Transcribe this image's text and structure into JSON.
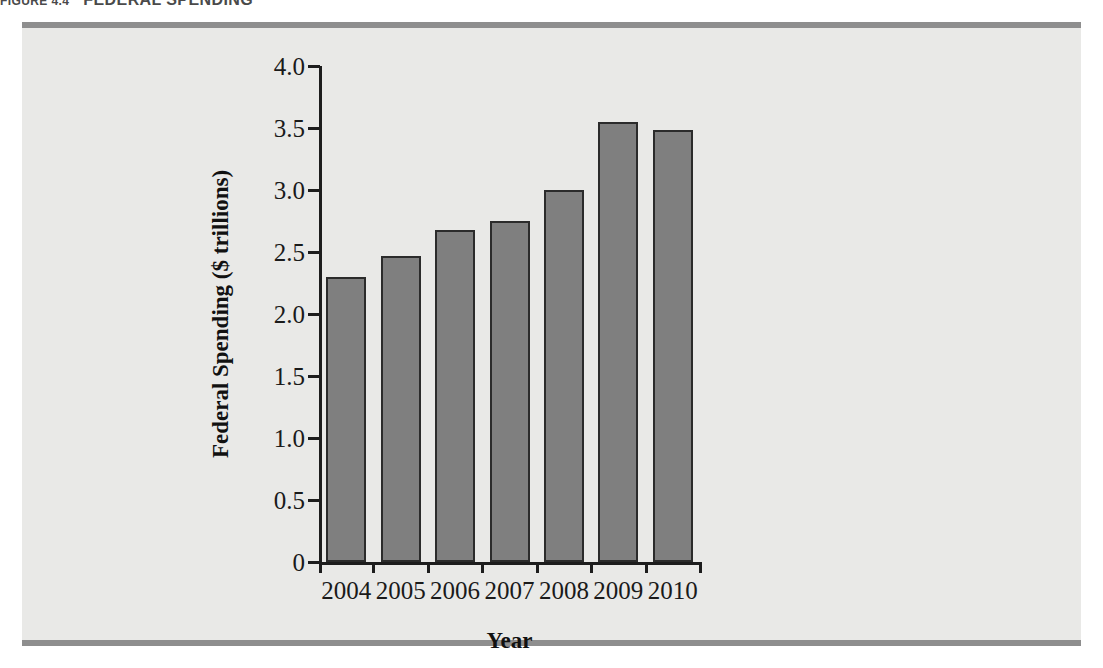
{
  "figure": {
    "number": "FIGURE 4.4",
    "title": "FEDERAL SPENDING"
  },
  "colors": {
    "panel_background": "#e9e9e7",
    "panel_rule": "#8e8e8e",
    "bar_fill": "#7f7f7f",
    "bar_border": "#2b2b2b",
    "axis": "#1d1d1d",
    "text": "#111111"
  },
  "chart_data": {
    "type": "bar",
    "title": "FEDERAL SPENDING",
    "categories": [
      "2004",
      "2005",
      "2006",
      "2007",
      "2008",
      "2009",
      "2010"
    ],
    "values": [
      2.3,
      2.47,
      2.68,
      2.75,
      3.0,
      3.55,
      3.48
    ],
    "xlabel": "Year",
    "ylabel": "Federal Spending ($ trillions)",
    "ylim": [
      0,
      4.0
    ],
    "ytick_labels": [
      "0",
      "0.5",
      "1.0",
      "1.5",
      "2.0",
      "2.5",
      "3.0",
      "3.5",
      "4.0"
    ],
    "ytick_values": [
      0,
      0.5,
      1.0,
      1.5,
      2.0,
      2.5,
      3.0,
      3.5,
      4.0
    ],
    "grid": false,
    "legend": null
  }
}
